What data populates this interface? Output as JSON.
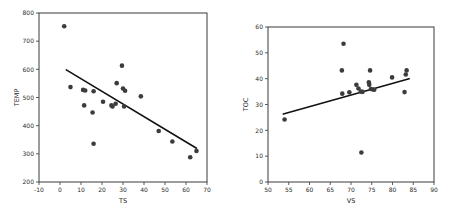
{
  "page": {
    "background": "#ffffff",
    "point_color": "#3c3c3c",
    "line_color": "#111111",
    "axis_color": "#3a3a3a"
  },
  "chart_data": [
    {
      "id": "temp-vs-ts",
      "type": "scatter",
      "title": "",
      "xlabel": "TS",
      "ylabel": "TEMP",
      "xlim": [
        -10,
        70
      ],
      "ylim": [
        200,
        800
      ],
      "xticks": [
        -10,
        0,
        10,
        20,
        30,
        40,
        50,
        60,
        70
      ],
      "xticklabels": [
        "-10",
        "0",
        "10",
        "20",
        "30",
        "40",
        "50",
        "60",
        "70"
      ],
      "yticks": [
        200,
        300,
        400,
        500,
        600,
        700,
        800
      ],
      "yticklabels": [
        "200",
        "300",
        "400",
        "500",
        "600",
        "700",
        "800"
      ],
      "grid": false,
      "legend": "none",
      "points": [
        {
          "x": 2.0,
          "y": 753
        },
        {
          "x": 5.0,
          "y": 537
        },
        {
          "x": 11.0,
          "y": 527
        },
        {
          "x": 12.0,
          "y": 525
        },
        {
          "x": 11.5,
          "y": 472
        },
        {
          "x": 16.0,
          "y": 522
        },
        {
          "x": 15.5,
          "y": 447
        },
        {
          "x": 16.0,
          "y": 336
        },
        {
          "x": 20.5,
          "y": 485
        },
        {
          "x": 24.5,
          "y": 472
        },
        {
          "x": 25.0,
          "y": 468
        },
        {
          "x": 26.5,
          "y": 478
        },
        {
          "x": 27.0,
          "y": 551
        },
        {
          "x": 29.5,
          "y": 613
        },
        {
          "x": 30.0,
          "y": 532
        },
        {
          "x": 31.0,
          "y": 524
        },
        {
          "x": 30.5,
          "y": 468
        },
        {
          "x": 38.5,
          "y": 504
        },
        {
          "x": 47.0,
          "y": 381
        },
        {
          "x": 53.5,
          "y": 344
        },
        {
          "x": 62.0,
          "y": 288
        },
        {
          "x": 65.0,
          "y": 310
        }
      ],
      "fit_line": {
        "x1": 3.0,
        "y1": 598,
        "x2": 65.0,
        "y2": 320
      }
    },
    {
      "id": "toc-vs-vs",
      "type": "scatter",
      "title": "",
      "xlabel": "VS",
      "ylabel": "TOC",
      "xlim": [
        50,
        90
      ],
      "ylim": [
        0,
        60
      ],
      "xticks": [
        50,
        55,
        60,
        65,
        70,
        75,
        80,
        85,
        90
      ],
      "xticklabels": [
        "50",
        "55",
        "60",
        "65",
        "70",
        "75",
        "80",
        "85",
        "90"
      ],
      "yticks": [
        0,
        10,
        20,
        30,
        40,
        50,
        60
      ],
      "yticklabels": [
        "0",
        "10",
        "20",
        "30",
        "40",
        "50",
        "60"
      ],
      "grid": false,
      "legend": "none",
      "points": [
        {
          "x": 54.0,
          "y": 24.2
        },
        {
          "x": 67.8,
          "y": 43.2
        },
        {
          "x": 67.9,
          "y": 34.2
        },
        {
          "x": 69.6,
          "y": 34.7
        },
        {
          "x": 68.2,
          "y": 53.5
        },
        {
          "x": 71.3,
          "y": 37.6
        },
        {
          "x": 71.8,
          "y": 36.2
        },
        {
          "x": 72.4,
          "y": 35.0
        },
        {
          "x": 72.8,
          "y": 34.9
        },
        {
          "x": 72.5,
          "y": 11.4
        },
        {
          "x": 74.3,
          "y": 38.6
        },
        {
          "x": 74.4,
          "y": 37.6
        },
        {
          "x": 74.6,
          "y": 43.2
        },
        {
          "x": 74.8,
          "y": 36.0
        },
        {
          "x": 75.3,
          "y": 35.8
        },
        {
          "x": 75.6,
          "y": 35.7
        },
        {
          "x": 79.9,
          "y": 40.5
        },
        {
          "x": 82.9,
          "y": 34.8
        },
        {
          "x": 83.2,
          "y": 41.6
        },
        {
          "x": 83.4,
          "y": 43.2
        }
      ],
      "fit_line": {
        "x1": 53.7,
        "y1": 26.3,
        "x2": 84.0,
        "y2": 40.0
      }
    }
  ]
}
